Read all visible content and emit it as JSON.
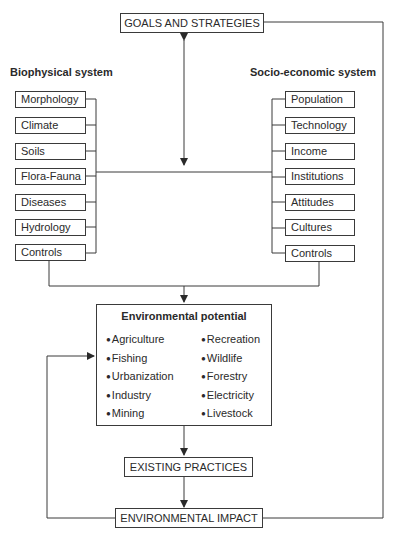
{
  "diagram": {
    "goals": "GOALS AND STRATEGIES",
    "biophysical": {
      "title": "Biophysical system",
      "items": [
        "Morphology",
        "Climate",
        "Soils",
        "Flora-Fauna",
        "Diseases",
        "Hydrology",
        "Controls"
      ]
    },
    "socio": {
      "title": "Socio-economic system",
      "items": [
        "Population",
        "Technology",
        "Income",
        "Institutions",
        "Attitudes",
        "Cultures",
        "Controls"
      ]
    },
    "potential": {
      "title": "Environmental potential",
      "left": [
        "Agriculture",
        "Fishing",
        "Urbanization",
        "Industry",
        "Mining"
      ],
      "right": [
        "Recreation",
        "Wildlife",
        "Forestry",
        "Electricity",
        "Livestock"
      ]
    },
    "practices": "EXISTING PRACTICES",
    "impact": "ENVIRONMENTAL IMPACT",
    "colors": {
      "line": "#3a3a3a",
      "text": "#2a2a2a",
      "background": "#ffffff"
    }
  }
}
